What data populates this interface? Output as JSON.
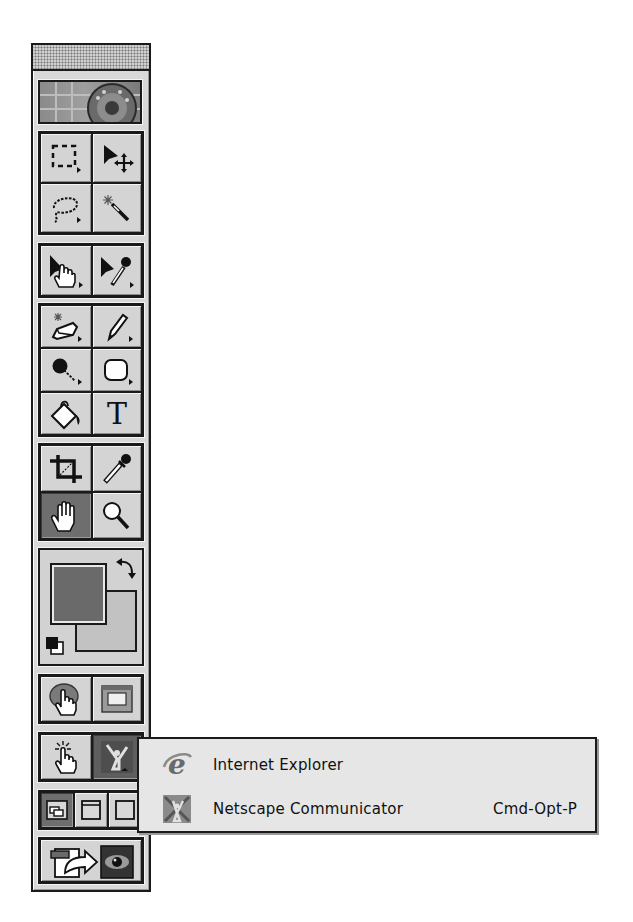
{
  "palette": {
    "name": "Toolbox",
    "title_bar": "drag-bar",
    "logo": "application-logo",
    "groups": [
      {
        "name": "selection",
        "tools": [
          {
            "id": "marquee",
            "icon": "rectangular-marquee-icon",
            "has_submenu": true,
            "active": false
          },
          {
            "id": "move",
            "icon": "move-icon",
            "has_submenu": false,
            "active": false
          },
          {
            "id": "lasso",
            "icon": "lasso-icon",
            "has_submenu": true,
            "active": false
          },
          {
            "id": "magic-wand",
            "icon": "magic-wand-icon",
            "has_submenu": false,
            "active": false
          }
        ]
      },
      {
        "name": "slice",
        "tools": [
          {
            "id": "image-map-select",
            "icon": "arrow-hand-icon",
            "has_submenu": true,
            "active": false
          },
          {
            "id": "direct-select",
            "icon": "arrow-eyedropper-icon",
            "has_submenu": true,
            "active": false
          }
        ]
      },
      {
        "name": "painting",
        "tools": [
          {
            "id": "eraser",
            "icon": "eraser-icon",
            "has_submenu": true,
            "active": false
          },
          {
            "id": "pencil",
            "icon": "pencil-icon",
            "has_submenu": true,
            "active": false
          },
          {
            "id": "brush",
            "icon": "brush-icon",
            "has_submenu": true,
            "active": false
          },
          {
            "id": "rounded-rectangle",
            "icon": "rounded-rectangle-icon",
            "has_submenu": true,
            "active": false
          },
          {
            "id": "paint-bucket",
            "icon": "paint-bucket-icon",
            "has_submenu": false,
            "active": false
          },
          {
            "id": "type",
            "icon": "type-icon",
            "glyph": "T",
            "has_submenu": false,
            "active": false
          }
        ]
      },
      {
        "name": "view",
        "tools": [
          {
            "id": "crop",
            "icon": "crop-icon",
            "has_submenu": false,
            "active": false
          },
          {
            "id": "eyedropper",
            "icon": "eyedropper-icon",
            "has_submenu": false,
            "active": false
          },
          {
            "id": "hand",
            "icon": "hand-icon",
            "has_submenu": false,
            "active": true
          },
          {
            "id": "zoom",
            "icon": "zoom-icon",
            "has_submenu": false,
            "active": false
          }
        ]
      }
    ],
    "colors": {
      "foreground": "#6a6a6a",
      "background": "#c2c2c2",
      "swap_icon": "swap-colors-icon",
      "default_icon": "default-colors-icon"
    },
    "rollover": [
      {
        "id": "rollover-hand",
        "icon": "rollover-hand-icon"
      },
      {
        "id": "image-map-visibility",
        "icon": "image-map-icon"
      }
    ],
    "preview": [
      {
        "id": "preview-hand",
        "icon": "preview-hand-icon"
      },
      {
        "id": "preview-in-browser",
        "icon": "netscape-browser-icon",
        "active": true
      }
    ],
    "screen_modes": [
      {
        "id": "standard-screen",
        "icon": "standard-screen-mode-icon",
        "active": true
      },
      {
        "id": "full-screen-menu",
        "icon": "full-screen-menu-mode-icon",
        "active": false
      },
      {
        "id": "full-screen",
        "icon": "full-screen-mode-icon",
        "active": false
      }
    ],
    "jump_to": [
      {
        "id": "jump-to-application",
        "icon": "jump-to-icon"
      },
      {
        "id": "jump-eye",
        "icon": "eye-icon"
      }
    ]
  },
  "popup_menu": {
    "items": [
      {
        "label": "Internet Explorer",
        "icon": "internet-explorer-icon",
        "shortcut": ""
      },
      {
        "label": "Netscape Communicator",
        "icon": "netscape-communicator-icon",
        "shortcut": "Cmd-Opt-P"
      }
    ]
  }
}
